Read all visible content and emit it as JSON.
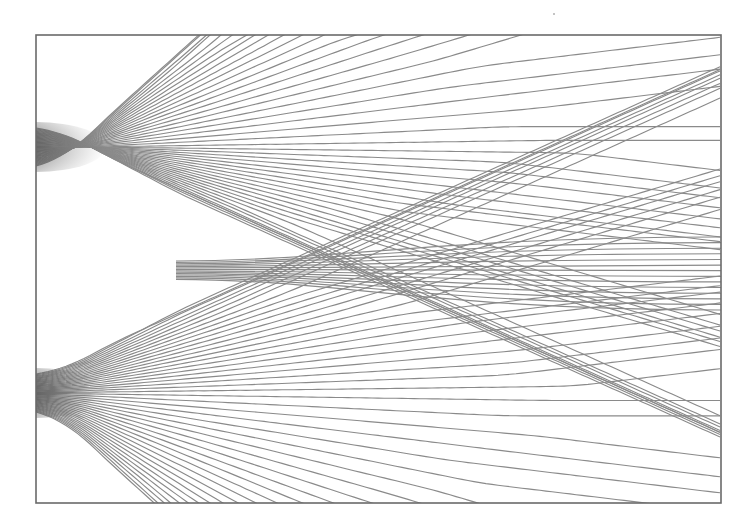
{
  "figure": {
    "frame": {
      "x0": 36,
      "y0": 35,
      "x1": 721,
      "y1": 503
    },
    "line_color": "#8a8a8a",
    "frame_color": "#6a6a6a",
    "background": "#ffffff",
    "sources": [
      {
        "name": "upper-source",
        "x": 36,
        "y": 147,
        "half_width": 19
      },
      {
        "name": "lower-source",
        "x": 36,
        "y": 393,
        "half_width": 19
      }
    ],
    "lines_per_source": 46,
    "beams": [
      {
        "name": "upper-outer-beam",
        "right_y_from": 40,
        "right_y_to": 100
      },
      {
        "name": "upper-middle-beam",
        "right_y_from": 110,
        "right_y_to": 175
      },
      {
        "name": "center-beam",
        "right_y_from": 237,
        "right_y_to": 310
      },
      {
        "name": "lower-middle-beam",
        "right_y_from": 345,
        "right_y_to": 420
      },
      {
        "name": "lower-outer-beam",
        "right_y_from": 430,
        "right_y_to": 500
      }
    ]
  }
}
